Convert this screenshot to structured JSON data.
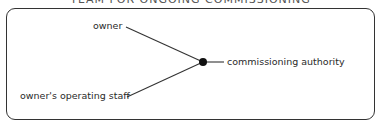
{
  "diagram": {
    "title": "TEAM FOR ONGOING COMMISSIONING",
    "nodes": [
      {
        "id": "owner",
        "label": "owner"
      },
      {
        "id": "staff",
        "label": "owner's operating staff"
      },
      {
        "id": "ca",
        "label": "commissioning authority"
      }
    ],
    "edges": [
      {
        "from": "owner",
        "to": "junction"
      },
      {
        "from": "staff",
        "to": "junction"
      },
      {
        "from": "junction",
        "to": "ca"
      }
    ]
  }
}
